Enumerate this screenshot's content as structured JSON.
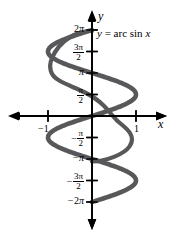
{
  "figure": {
    "kind": "math-graph",
    "background_color": "#ffffff",
    "curve_color": "#58585a",
    "axis_color": "#000000",
    "equation": {
      "lhs": "y",
      "equals": "=",
      "function": "arc sin",
      "variable": "x",
      "full_text": "y = arc sin x"
    },
    "axes": {
      "x_label": "x",
      "y_label": "y",
      "x_ticks": [
        {
          "value": -1,
          "label": "−1"
        },
        {
          "value": 1,
          "label": "1"
        }
      ],
      "y_ticks": [
        {
          "value": 6.2832,
          "label": "2π",
          "sign": "−",
          "has_sign": false,
          "lead": "2",
          "numerator": "",
          "denominator": ""
        },
        {
          "value": 4.7124,
          "label": "3π/2",
          "has_sign": false,
          "lead": "",
          "numerator": "3π",
          "denominator": "2"
        },
        {
          "value": 3.1416,
          "label": "π",
          "has_sign": false,
          "lead": "",
          "numerator": "",
          "denominator": ""
        },
        {
          "value": 1.5708,
          "label": "π/2",
          "has_sign": false,
          "lead": "",
          "numerator": "π",
          "denominator": "2"
        },
        {
          "value": -1.5708,
          "label": "−π/2",
          "has_sign": true,
          "lead": "",
          "numerator": "π",
          "denominator": "2"
        },
        {
          "value": -3.1416,
          "label": "−π",
          "has_sign": true,
          "lead": "",
          "numerator": "",
          "denominator": ""
        },
        {
          "value": -4.7124,
          "label": "−3π/2",
          "has_sign": true,
          "lead": "",
          "numerator": "3π",
          "denominator": "2"
        },
        {
          "value": -6.2832,
          "label": "−2π",
          "has_sign": true,
          "lead": "2",
          "numerator": "",
          "denominator": ""
        }
      ]
    }
  },
  "labels": {
    "y_2pi": "2",
    "y_2pi_pi": "π",
    "y_3pi_over_2_num": "3π",
    "y_3pi_over_2_den": "2",
    "y_pi": "π",
    "y_pi_over_2_num": "π",
    "y_pi_over_2_den": "2",
    "y_neg_pi_over_2_sign": "−",
    "y_neg_pi_over_2_num": "π",
    "y_neg_pi_over_2_den": "2",
    "y_neg_pi_sign": "−",
    "y_neg_pi": "π",
    "y_neg_3pi_over_2_sign": "−",
    "y_neg_3pi_over_2_num": "3π",
    "y_neg_3pi_over_2_den": "2",
    "y_neg_2pi_sign": "−",
    "y_neg_2pi_lead": "2",
    "y_neg_2pi_pi": "π",
    "x_neg_1": "−1",
    "x_1": "1",
    "x_axis": "x",
    "y_axis": "y",
    "eq_lhs": "y",
    "eq_equals": "=",
    "eq_fn": "arc sin",
    "eq_var": "x"
  },
  "chart_data": {
    "type": "line",
    "title": "y = arc sin x",
    "xlabel": "x",
    "ylabel": "y",
    "xlim": [
      -1.6,
      1.6
    ],
    "ylim": [
      -6.2832,
      6.2832
    ],
    "grid": false,
    "legend": null,
    "x_ticks": [
      -1,
      1
    ],
    "y_ticks": [
      -6.2832,
      -4.7124,
      -3.1416,
      -1.5708,
      1.5708,
      3.1416,
      4.7124,
      6.2832
    ],
    "y_tick_labels": [
      "−2π",
      "−3π/2",
      "−π",
      "−π/2",
      "π/2",
      "π",
      "3π/2",
      "2π"
    ],
    "series": [
      {
        "name": "x = sin y",
        "parametric": true,
        "parameter": "y",
        "points": [
          {
            "x": 0.0,
            "y": 6.2832
          },
          {
            "x": -0.3827,
            "y": 5.8905
          },
          {
            "x": -0.7071,
            "y": 5.4978
          },
          {
            "x": -0.9239,
            "y": 5.1051
          },
          {
            "x": -1.0,
            "y": 4.7124
          },
          {
            "x": -0.9239,
            "y": 4.3197
          },
          {
            "x": -0.7071,
            "y": 3.927
          },
          {
            "x": -0.3827,
            "y": 3.5343
          },
          {
            "x": 0.0,
            "y": 3.1416
          },
          {
            "x": 0.3827,
            "y": 2.7489
          },
          {
            "x": 0.7071,
            "y": 2.3562
          },
          {
            "x": 0.9239,
            "y": 1.9635
          },
          {
            "x": 1.0,
            "y": 1.5708
          },
          {
            "x": 0.9239,
            "y": 1.1781
          },
          {
            "x": 0.7071,
            "y": 0.7854
          },
          {
            "x": 0.3827,
            "y": 0.3927
          },
          {
            "x": 0.0,
            "y": 0.0
          },
          {
            "x": -0.3827,
            "y": -0.3927
          },
          {
            "x": -0.7071,
            "y": -0.7854
          },
          {
            "x": -0.9239,
            "y": -1.1781
          },
          {
            "x": -1.0,
            "y": -1.5708
          },
          {
            "x": -0.9239,
            "y": -1.9635
          },
          {
            "x": -0.7071,
            "y": -2.3562
          },
          {
            "x": -0.3827,
            "y": -2.7489
          },
          {
            "x": 0.0,
            "y": -3.1416
          },
          {
            "x": 0.3827,
            "y": -3.5343
          },
          {
            "x": 0.7071,
            "y": -3.927
          },
          {
            "x": 0.9239,
            "y": -4.3197
          },
          {
            "x": 1.0,
            "y": -4.7124
          },
          {
            "x": 0.9239,
            "y": -5.1051
          },
          {
            "x": 0.7071,
            "y": -5.4978
          },
          {
            "x": 0.3827,
            "y": -5.8905
          },
          {
            "x": 0.0,
            "y": -6.2832
          }
        ]
      }
    ]
  }
}
